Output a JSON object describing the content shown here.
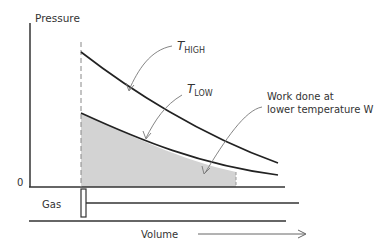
{
  "diagram": {
    "y_axis_label": "Pressure",
    "x_axis_label": "Volume",
    "zero_label": "0",
    "cylinder_label": "Gas",
    "curves": [
      {
        "name": "T_HIGH",
        "symbol": "T",
        "subscript": "HIGH"
      },
      {
        "name": "T_LOW",
        "symbol": "T",
        "subscript": "LOW"
      }
    ],
    "annotation": {
      "line1": "Work done at",
      "line2": "lower temperature W"
    },
    "colors": {
      "line": "#222222",
      "shaded_area": "#d3d3d3",
      "arrow": "#666666",
      "text": "#333333"
    }
  }
}
